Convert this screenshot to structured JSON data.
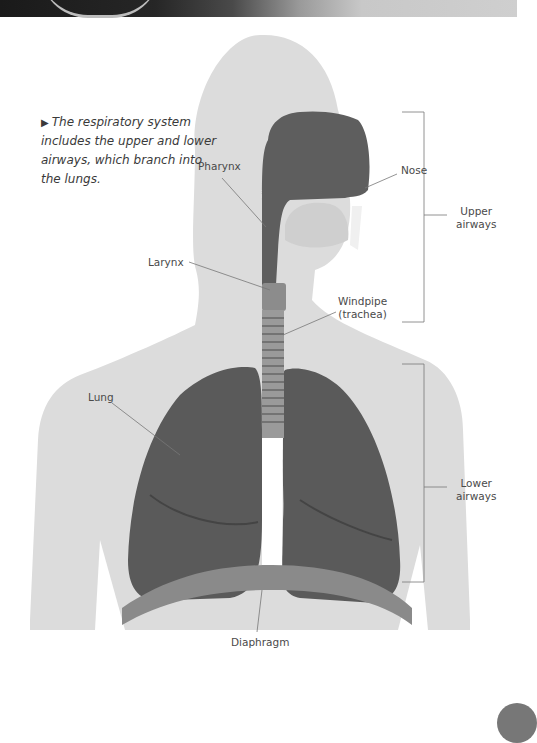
{
  "caption": {
    "marker": "▶",
    "text": "The respiratory system includes the upper and lower airways, which branch into the lungs."
  },
  "labels": {
    "pharynx": "Pharynx",
    "nose": "Nose",
    "larynx": "Larynx",
    "windpipe_line1": "Windpipe",
    "windpipe_line2": "(trachea)",
    "lung": "Lung",
    "diaphragm": "Diaphragm",
    "upper_airways_line1": "Upper",
    "upper_airways_line2": "airways",
    "lower_airways_line1": "Lower",
    "lower_airways_line2": "airways"
  },
  "colors": {
    "silhouette": "#dcdcdc",
    "airway": "#5e5e5e",
    "lung": "#5a5a5a",
    "trachea": "#9a9a9a",
    "diaphragm": "#8a8a8a",
    "leader_line": "#777777",
    "label_text": "#4a4a4a"
  }
}
